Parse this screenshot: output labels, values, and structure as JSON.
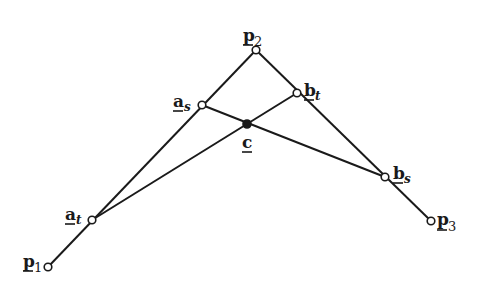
{
  "diagram": {
    "type": "geometric-construction",
    "colors": {
      "stroke": "#1a1a1a",
      "background": "#ffffff",
      "open_point_fill": "#ffffff"
    },
    "points": {
      "p1": {
        "label": "p",
        "sub": "1",
        "x": 48,
        "y": 267,
        "style": "open"
      },
      "p2": {
        "label": "p",
        "sub": "2",
        "x": 256,
        "y": 50,
        "style": "open"
      },
      "p3": {
        "label": "p",
        "sub": "3",
        "x": 431,
        "y": 221,
        "style": "open"
      },
      "a_t": {
        "label": "a",
        "sub": "t",
        "x": 92,
        "y": 220,
        "style": "open"
      },
      "a_s": {
        "label": "a",
        "sub": "s",
        "x": 202,
        "y": 105,
        "style": "open"
      },
      "b_t": {
        "label": "b",
        "sub": "t",
        "x": 297,
        "y": 93,
        "style": "open"
      },
      "b_s": {
        "label": "b",
        "sub": "s",
        "x": 385,
        "y": 177,
        "style": "open"
      },
      "c": {
        "label": "c",
        "sub": "",
        "x": 247,
        "y": 124,
        "style": "filled"
      }
    },
    "segments": [
      [
        "p1",
        "p2"
      ],
      [
        "p2",
        "p3"
      ],
      [
        "a_t",
        "b_t"
      ],
      [
        "a_s",
        "b_s"
      ]
    ]
  }
}
